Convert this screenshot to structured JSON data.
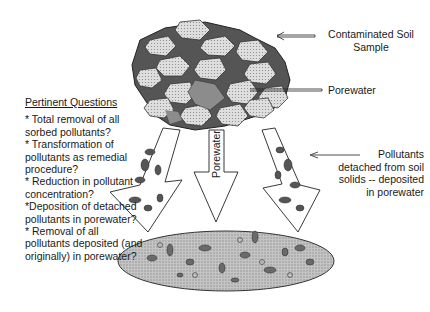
{
  "diagram": {
    "labels": {
      "soil_sample": [
        "Contaminated Soil",
        "Sample"
      ],
      "porewater_right": "Porewater",
      "porewater_center": "Porewater",
      "pollutants_detached": [
        "Pollutants",
        "detached from soil",
        "solids -- deposited",
        "in porewater"
      ]
    },
    "questions": {
      "title": "Pertinent Questions",
      "items": [
        "* Total removal of all sorbed pollutants?",
        "* Transformation of pollutants as remedial procedure?",
        "* Reduction in pollutant concentration?",
        "*Deposition of detached pollutants in porewater?",
        "* Removal of all pollutants deposited (and originally)  in porewater?"
      ]
    },
    "colors": {
      "ink": "#1a1a1a",
      "grain_fill": "#d6d6d6",
      "porewater_fill": "#8c8c8c",
      "ellipse_fill": "#bdbdbd"
    }
  }
}
